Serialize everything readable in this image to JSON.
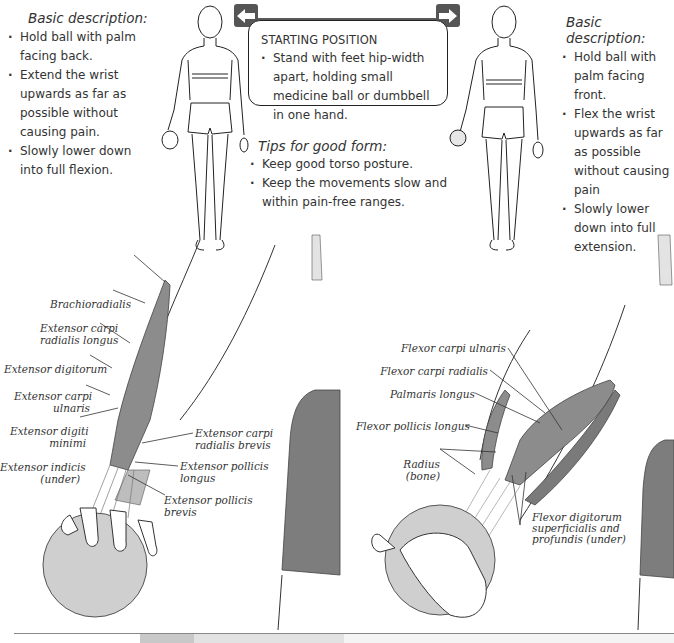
{
  "left_description": {
    "title": "Basic description:",
    "bullets": [
      "Hold ball with palm facing back.",
      "Extend the wrist upwards as far as possible without causing pain.",
      "Slowly lower down into full flexion."
    ]
  },
  "right_description": {
    "title": "Basic description:",
    "bullets": [
      "Hold ball with palm facing front.",
      "Flex the wrist upwards as far as possible without causing pain",
      "Slowly lower down into full extension."
    ]
  },
  "starting_position": {
    "title": "STARTING POSITION",
    "bullets": [
      "Stand with feet hip-width apart, holding small medicine ball or dumbbell in one hand."
    ]
  },
  "tips": {
    "title": "Tips for good form:",
    "bullets": [
      "Keep good torso posture.",
      "Keep the movements slow and within pain-free ranges."
    ]
  },
  "nav": {
    "left_arrow_icon": "arrow-left-icon",
    "right_arrow_icon": "arrow-right-icon"
  },
  "extensor_labels": {
    "brachioradialis": "Brachioradialis",
    "ecr_longus": [
      "Extensor carpi",
      "radialis longus"
    ],
    "ext_digitorum": "Extensor digitorum",
    "ecu": [
      "Extensor carpi",
      "ulnaris"
    ],
    "ext_digiti_minimi": [
      "Extensor digiti",
      "minimi"
    ],
    "ext_indicis": [
      "Extensor indicis",
      "(under)"
    ],
    "ecr_brevis": [
      "Extensor carpi",
      "radialis brevis"
    ],
    "epl": [
      "Extensor pollicis",
      "longus"
    ],
    "epb": [
      "Extensor pollicis",
      "brevis"
    ]
  },
  "flexor_labels": {
    "fcu": "Flexor carpi ulnaris",
    "fcr": "Flexor carpi radialis",
    "palmaris": "Palmaris longus",
    "fpl": "Flexor pollicis longus",
    "radius": [
      "Radius",
      "(bone)"
    ],
    "fds": [
      "Flexor digitorum",
      "superficialis and",
      "profundis (under)"
    ]
  },
  "colors": {
    "muscle": "#8c8c8c",
    "ball": "#cfcfcf",
    "shorts": "#7d7d7d",
    "arrow_button": "#555555",
    "line": "#2a2a2a"
  }
}
